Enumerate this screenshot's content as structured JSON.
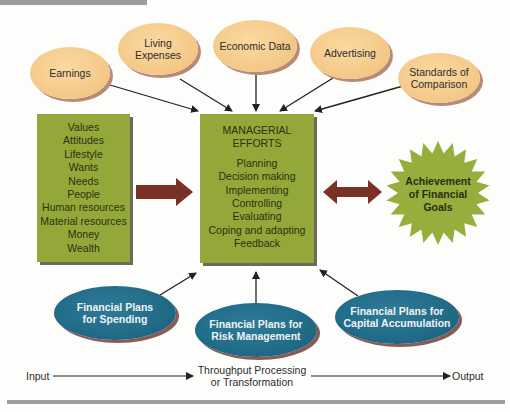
{
  "inputs_top": [
    {
      "label": "Earnings"
    },
    {
      "label": "Living Expenses",
      "lines": [
        "Living",
        "Expenses"
      ]
    },
    {
      "label": "Economic Data"
    },
    {
      "label": "Advertising"
    },
    {
      "label": "Standards of Comparison",
      "lines": [
        "Standards of",
        "Comparison"
      ]
    }
  ],
  "left_box": {
    "items": [
      "Values",
      "Attitudes",
      "Lifestyle",
      "Wants",
      "Needs",
      "People",
      "Human resources",
      "Material resources",
      "Money",
      "Wealth"
    ]
  },
  "center_box": {
    "title_lines": [
      "MANAGERIAL",
      "EFFORTS"
    ],
    "items": [
      "Planning",
      "Decision making",
      "Implementing",
      "Controlling",
      "Evaluating",
      "Coping and adapting",
      "Feedback"
    ]
  },
  "goal": {
    "lines": [
      "Achievement",
      "of Financial",
      "Goals"
    ]
  },
  "plans_bottom": [
    {
      "lines": [
        "Financial Plans",
        "for Spending"
      ]
    },
    {
      "lines": [
        "Financial Plans for",
        "Risk Management"
      ]
    },
    {
      "lines": [
        "Financial Plans for",
        "Capital Accumulation"
      ]
    }
  ],
  "flow": {
    "input": "Input",
    "throughput_lines": [
      "Throughput Processing",
      "or Transformation"
    ],
    "output": "Output"
  },
  "colors": {
    "tan_oval": "#f3c886",
    "green_box": "#94a83a",
    "blue_oval": "#1e6884",
    "arrow_red": "#7a3226",
    "star_green": "#97ae3c"
  }
}
